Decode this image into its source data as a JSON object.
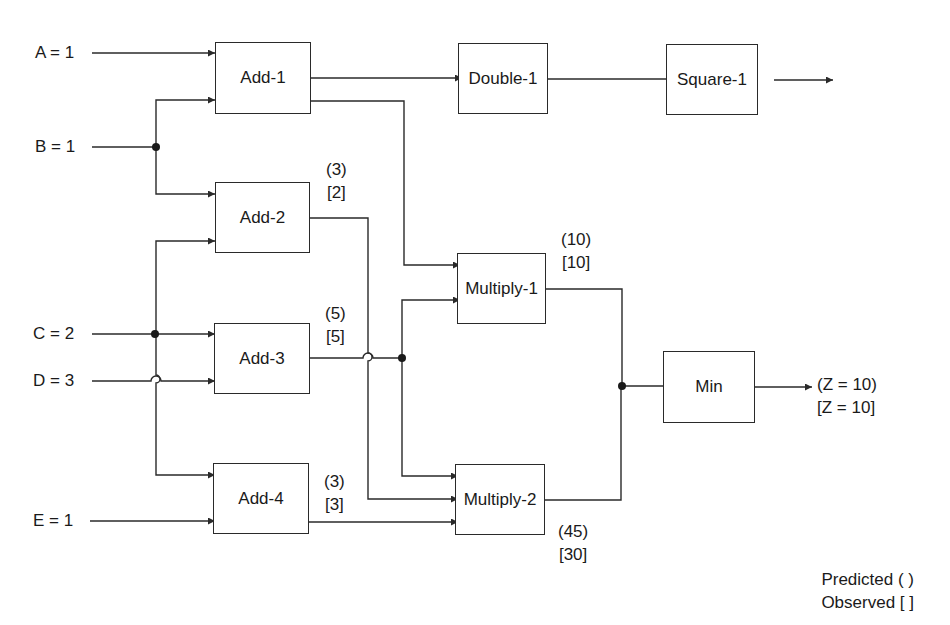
{
  "inputs": [
    {
      "id": "A",
      "label": "A = 1"
    },
    {
      "id": "B",
      "label": "B = 1"
    },
    {
      "id": "C",
      "label": "C = 2"
    },
    {
      "id": "D",
      "label": "D = 3"
    },
    {
      "id": "E",
      "label": "E = 1"
    }
  ],
  "blocks": {
    "add1": "Add-1",
    "add2": "Add-2",
    "add3": "Add-3",
    "add4": "Add-4",
    "double1": "Double-1",
    "square1": "Square-1",
    "multiply1": "Multiply-1",
    "multiply2": "Multiply-2",
    "min": "Min"
  },
  "annotations": {
    "add2": {
      "predicted": "(3)",
      "observed": "[2]"
    },
    "add3": {
      "predicted": "(5)",
      "observed": "[5]"
    },
    "add4": {
      "predicted": "(3)",
      "observed": "[3]"
    },
    "multiply1": {
      "predicted": "(10)",
      "observed": "[10]"
    },
    "multiply2": {
      "predicted": "(45)",
      "observed": "[30]"
    },
    "output": {
      "predicted": "(Z = 10)",
      "observed": "[Z = 10]"
    }
  },
  "legend": {
    "predicted": "Predicted ( )",
    "observed": "Observed [ ]"
  },
  "colors": {
    "line": "#2a2a2a",
    "background": "#ffffff"
  }
}
